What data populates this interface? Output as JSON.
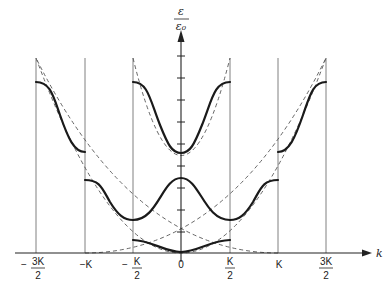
{
  "diagram": {
    "y_axis": {
      "label_numerator": "ε",
      "label_denominator": "ε₀"
    },
    "x_axis": {
      "label": "k",
      "ticks": [
        {
          "sign": "−",
          "num": "3K",
          "den": "2",
          "x": 36
        },
        {
          "sign": "",
          "num": "−K",
          "den": "",
          "x": 85
        },
        {
          "sign": "−",
          "num": "K",
          "den": "2",
          "x": 133
        },
        {
          "sign": "",
          "num": "0",
          "den": "",
          "x": 181
        },
        {
          "sign": "",
          "num": "K",
          "den": "2",
          "x": 230
        },
        {
          "sign": "",
          "num": "K",
          "den": "",
          "x": 278
        },
        {
          "sign": "",
          "num": "3K",
          "den": "2",
          "x": 326
        }
      ]
    },
    "colors": {
      "band": "#1a1a1a",
      "boundary": "#777777",
      "free_electron": "#555555",
      "axis": "#222222"
    }
  }
}
